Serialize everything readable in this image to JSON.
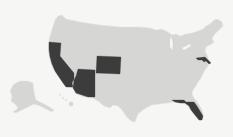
{
  "map": {
    "title": "United States map with highlighted states",
    "base_color": "#d6d6d4",
    "highlight_color": "#3c3c3c",
    "background_color": "#f6f6f4",
    "highlighted_states": [
      "California",
      "Arizona",
      "Colorado",
      "Maryland",
      "Florida"
    ]
  }
}
